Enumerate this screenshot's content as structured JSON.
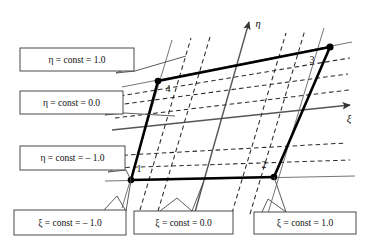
{
  "figure": {
    "background_color": "#ffffff",
    "line_color": "#000000",
    "grid_color": "#2b2b2b",
    "box_stroke_color": "#4a4a4a"
  },
  "axes": [
    {
      "id": "eta-axis",
      "label": "η",
      "label_x": 258,
      "label_y": 26,
      "x1": 198,
      "y1": 165,
      "x2": 249,
      "y2": 22
    },
    {
      "id": "xi-axis",
      "label": "ξ",
      "label_x": 349,
      "label_y": 122,
      "x1": 196,
      "y1": 124,
      "x2": 350,
      "y2": 105
    }
  ],
  "nodes": [
    {
      "id": "node-1",
      "label": "1",
      "x": 131,
      "y": 180,
      "label_x": 139,
      "label_y": 172
    },
    {
      "id": "node-2",
      "label": "2",
      "x": 274,
      "y": 177,
      "label_x": 264,
      "label_y": 168
    },
    {
      "id": "node-3",
      "label": "3",
      "x": 330,
      "y": 47,
      "label_x": 312,
      "label_y": 63
    },
    {
      "id": "node-4",
      "label": "4",
      "x": 158,
      "y": 81,
      "label_x": 168,
      "label_y": 92
    }
  ],
  "element_edges": [
    {
      "id": "edge-1-2",
      "from": "node-1",
      "to": "node-2"
    },
    {
      "id": "edge-2-3",
      "from": "node-2",
      "to": "node-3"
    },
    {
      "id": "edge-3-4",
      "from": "node-3",
      "to": "node-4"
    },
    {
      "id": "edge-4-1",
      "from": "node-4",
      "to": "node-1"
    }
  ],
  "callouts": [
    {
      "id": "eta-const-plus-one",
      "family": "eta",
      "symbol": "η",
      "text": "η = const = 1.0",
      "value": "1.0",
      "box": {
        "x": 20,
        "y": 48,
        "w": 114,
        "h": 23
      },
      "leader": "M 134 66 L 116 73 L 135 71 L 186 56"
    },
    {
      "id": "eta-const-zero",
      "family": "eta",
      "symbol": "η",
      "text": "η = const = 0.0",
      "value": "0.0",
      "box": {
        "x": 20,
        "y": 91,
        "w": 103,
        "h": 23
      },
      "leader": "M 123 108 L 105 115 L 124 113 L 175 116"
    },
    {
      "id": "eta-const-minus-one",
      "family": "eta",
      "symbol": "η",
      "text": "η = const = – 1.0",
      "value": "– 1.0",
      "box": {
        "x": 20,
        "y": 146,
        "w": 105,
        "h": 24
      },
      "leader": "M 125 164 L 108 172 L 126 170 L 131 180"
    },
    {
      "id": "xi-const-minus-one",
      "family": "xi",
      "symbol": "ξ",
      "text": "ξ = const = – 1.0",
      "value": "– 1.0",
      "box": {
        "x": 14,
        "y": 210,
        "w": 112,
        "h": 25
      },
      "leader": "M 104 210 L 117 196 L 126 211 L 131 180"
    },
    {
      "id": "xi-const-zero",
      "family": "xi",
      "symbol": "ξ",
      "text": "ξ = const = 0.0",
      "value": "0.0",
      "box": {
        "x": 134,
        "y": 211,
        "w": 99,
        "h": 23
      },
      "leader": "M 160 211 L 177 198 L 192 211 L 203 183"
    },
    {
      "id": "xi-const-plus-one",
      "family": "xi",
      "symbol": "ξ",
      "text": "ξ = const = 1.0",
      "value": "1.0",
      "box": {
        "x": 254,
        "y": 212,
        "w": 102,
        "h": 22
      },
      "leader": "M 262 212 L 268 199 L 286 212 L 274 177"
    }
  ],
  "grid": {
    "description": "Two families of coordinate lines: dashed interior subdivisions plus solid lines coincident with the axes and element edges, extended beyond the element.",
    "eta_const_count": 5,
    "xi_const_count": 5,
    "dash_pattern": "4.5 3.2"
  }
}
